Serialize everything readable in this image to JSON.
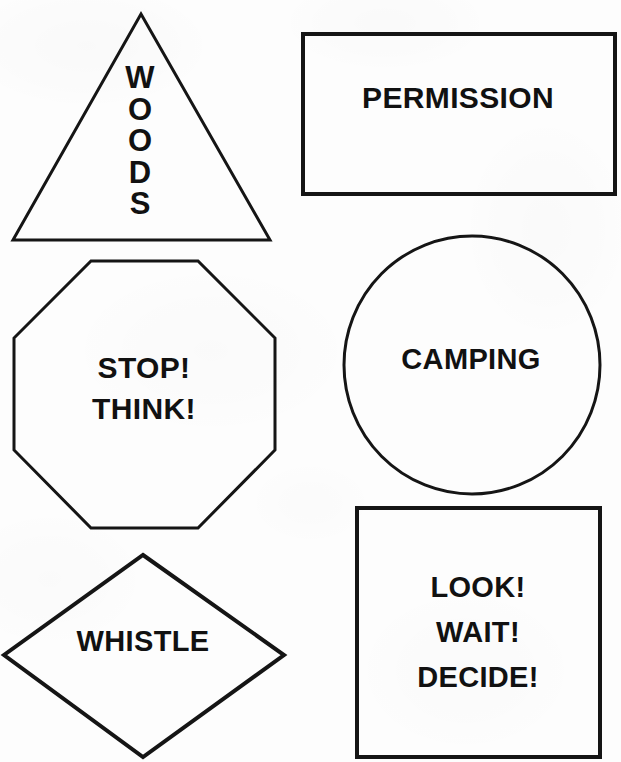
{
  "page": {
    "background_color": "#fdfdfd",
    "ink_color": "#151515",
    "text_color": "#111111",
    "width": 621,
    "height": 762
  },
  "shapes": [
    {
      "id": "triangle",
      "icon": "triangle-shape",
      "label": "W\nO\nO\nD\nS",
      "text_plain": "WOODS",
      "orientation": "vertical-stacked",
      "stroke": "#151515",
      "stroke_width": 3
    },
    {
      "id": "rectangle",
      "icon": "rectangle-shape",
      "label": "PERMISSION",
      "orientation": "horizontal",
      "stroke": "#151515",
      "stroke_width": 4
    },
    {
      "id": "octagon",
      "icon": "octagon-shape",
      "label": "STOP!\nTHINK!",
      "text_plain": "STOP! THINK!",
      "orientation": "horizontal",
      "stroke": "#151515",
      "stroke_width": 3
    },
    {
      "id": "ellipse",
      "icon": "ellipse-shape",
      "label": "CAMPING",
      "orientation": "horizontal",
      "stroke": "#151515",
      "stroke_width": 3
    },
    {
      "id": "diamond",
      "icon": "diamond-shape",
      "label": "WHISTLE",
      "orientation": "horizontal",
      "stroke": "#151515",
      "stroke_width": 4
    },
    {
      "id": "square",
      "icon": "square-shape",
      "label": "LOOK!\nWAIT!\nDECIDE!",
      "text_plain": "LOOK! WAIT! DECIDE!",
      "orientation": "horizontal",
      "stroke": "#151515",
      "stroke_width": 4
    }
  ]
}
